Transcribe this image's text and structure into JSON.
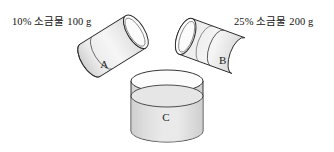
{
  "diagram": {
    "background_color": "#ffffff",
    "stroke_color": "#2b2b2b",
    "fill_color": "#e9e9e9",
    "labels": {
      "container_a": "10% 소금물 100 g",
      "container_b": "25% 소금물 200 g"
    },
    "vessels": [
      {
        "id": "A",
        "letter": "A",
        "orientation": "tilted-left",
        "rotation_deg": -32,
        "contents_label": "10% 소금물 100 g",
        "concentration": "10%",
        "mass": "100 g"
      },
      {
        "id": "B",
        "letter": "B",
        "orientation": "tilted-right",
        "rotation_deg": 20,
        "contents_label": "25% 소금물 200 g",
        "concentration": "25%",
        "mass": "200 g"
      },
      {
        "id": "C",
        "letter": "C",
        "orientation": "upright",
        "rotation_deg": 0,
        "contents_label": "",
        "concentration": "",
        "mass": ""
      }
    ]
  }
}
